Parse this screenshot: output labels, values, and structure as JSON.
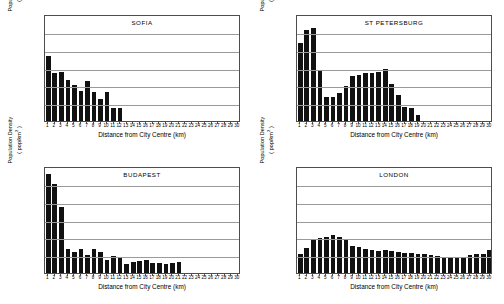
{
  "figure": {
    "axis": {
      "ylabel_line1": "Population Density",
      "ylabel_line2": "( pop/km2 )",
      "ylabel_unit_sup": "2",
      "xlabel": "Distance from City Centre (km)",
      "yticks": [
        0,
        50,
        100,
        150,
        200,
        250,
        300
      ],
      "xticks": [
        1,
        2,
        3,
        4,
        5,
        6,
        7,
        8,
        9,
        10,
        11,
        12,
        13,
        14,
        15,
        16,
        17,
        18,
        19,
        20,
        21,
        22,
        23,
        24,
        25,
        26,
        27,
        28,
        29,
        30
      ],
      "ylim": [
        0,
        300
      ],
      "xlim": [
        0.5,
        30.5
      ],
      "bar_color": "#111111",
      "gridline_color": "#9a9a9a",
      "frame_color": "#4d4d4d"
    }
  },
  "chart_data": [
    {
      "type": "bar",
      "title": "SOFIA",
      "xlabel": "Distance from City Centre (km)",
      "ylabel": "Population Density ( pop/km2 )",
      "ylim": [
        0,
        300
      ],
      "xlim": [
        0.5,
        30.5
      ],
      "grid": true,
      "legend": "none",
      "categories": [
        1,
        2,
        3,
        4,
        5,
        6,
        7,
        8,
        9,
        10,
        11,
        12,
        13,
        14,
        15,
        16,
        17,
        18,
        19,
        20,
        21,
        22,
        23,
        24,
        25,
        26,
        27,
        28,
        29,
        30
      ],
      "values": [
        181,
        134,
        137,
        116,
        100,
        85,
        113,
        80,
        63,
        82,
        37,
        36,
        0,
        0,
        0,
        0,
        0,
        0,
        0,
        0,
        0,
        0,
        0,
        0,
        0,
        0,
        0,
        0,
        0,
        0
      ]
    },
    {
      "type": "bar",
      "title": "ST PETERSBURG",
      "xlabel": "Distance from City Centre (km)",
      "ylabel": "Population Density ( pop/km2 )",
      "ylim": [
        0,
        300
      ],
      "xlim": [
        0.5,
        30.5
      ],
      "grid": true,
      "legend": "none",
      "categories": [
        1,
        2,
        3,
        4,
        5,
        6,
        7,
        8,
        9,
        10,
        11,
        12,
        13,
        14,
        15,
        16,
        17,
        18,
        19,
        20,
        21,
        22,
        23,
        24,
        25,
        26,
        27,
        28,
        29,
        30
      ],
      "values": [
        220,
        255,
        260,
        140,
        66,
        67,
        79,
        99,
        127,
        128,
        135,
        135,
        138,
        147,
        105,
        74,
        38,
        37,
        18,
        0,
        0,
        0,
        0,
        0,
        0,
        0,
        0,
        0,
        0,
        0
      ]
    },
    {
      "type": "bar",
      "title": "BUDAPEST",
      "xlabel": "Distance from City Centre (km)",
      "ylabel": "Population Density ( pop/km2 )",
      "ylim": [
        0,
        300
      ],
      "xlim": [
        0.5,
        30.5
      ],
      "grid": true,
      "legend": "none",
      "categories": [
        1,
        2,
        3,
        4,
        5,
        6,
        7,
        8,
        9,
        10,
        11,
        12,
        13,
        14,
        15,
        16,
        17,
        18,
        19,
        20,
        21,
        22,
        23,
        24,
        25,
        26,
        27,
        28,
        29,
        30
      ],
      "values": [
        278,
        249,
        185,
        68,
        60,
        66,
        50,
        67,
        59,
        37,
        48,
        41,
        25,
        30,
        35,
        37,
        28,
        27,
        24,
        27,
        30,
        0,
        0,
        0,
        0,
        0,
        0,
        0,
        0,
        0
      ]
    },
    {
      "type": "bar",
      "title": "LONDON",
      "xlabel": "Distance from City Centre (km)",
      "ylabel": "Population Density ( pop/km2 )",
      "ylim": [
        0,
        300
      ],
      "xlim": [
        0.5,
        30.5
      ],
      "grid": true,
      "legend": "none",
      "categories": [
        1,
        2,
        3,
        4,
        5,
        6,
        7,
        8,
        9,
        10,
        11,
        12,
        13,
        14,
        15,
        16,
        17,
        18,
        19,
        20,
        21,
        22,
        23,
        24,
        25,
        26,
        27,
        28,
        29,
        30
      ],
      "values": [
        52,
        70,
        94,
        97,
        101,
        106,
        100,
        93,
        77,
        72,
        66,
        64,
        63,
        64,
        63,
        60,
        56,
        55,
        53,
        52,
        50,
        47,
        44,
        44,
        45,
        46,
        50,
        54,
        53,
        64
      ]
    }
  ]
}
